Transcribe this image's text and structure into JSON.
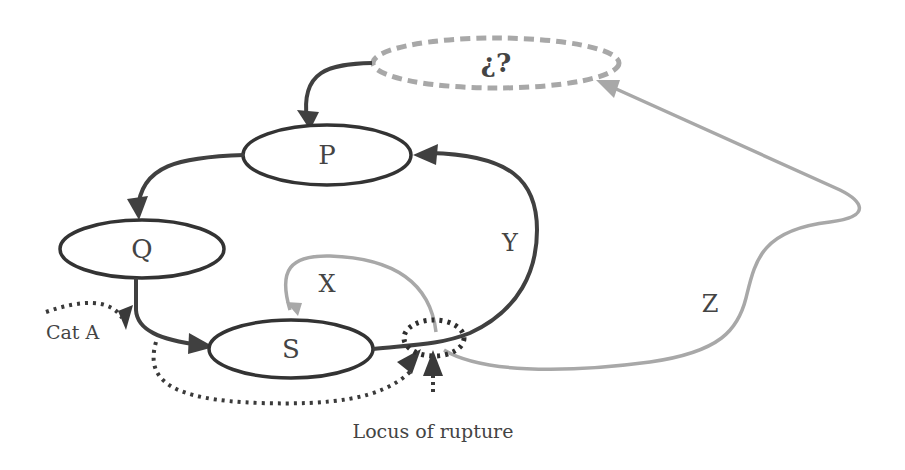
{
  "diagram": {
    "colors": {
      "dark": "#404040",
      "light": "#a8a8a8",
      "dotted": "#3a3a3a",
      "text": "#444444"
    },
    "nodes": {
      "unknown": {
        "label": "¿?",
        "style": "dashed-light"
      },
      "P": {
        "label": "P"
      },
      "Q": {
        "label": "Q"
      },
      "S": {
        "label": "S"
      }
    },
    "edges": {
      "unknown_to_P": {
        "from": "¿?",
        "to": "P",
        "style": "solid-dark"
      },
      "P_to_Q": {
        "from": "P",
        "to": "Q",
        "style": "solid-dark"
      },
      "Q_to_S": {
        "from": "Q",
        "to": "S",
        "style": "solid-dark"
      },
      "X": {
        "label": "X",
        "from": "locus",
        "to": "S",
        "style": "solid-light"
      },
      "Y": {
        "label": "Y",
        "from": "S",
        "to": "P",
        "style": "solid-dark"
      },
      "Z": {
        "label": "Z",
        "from": "locus",
        "to": "¿?",
        "style": "solid-light"
      },
      "catA": {
        "label": "Cat A",
        "style": "dotted-dark"
      }
    },
    "annotations": {
      "locus": "Locus of rupture"
    }
  }
}
